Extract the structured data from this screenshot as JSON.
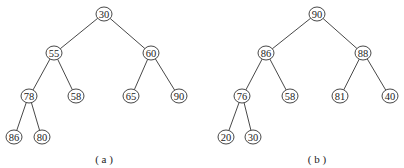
{
  "trees": [
    {
      "caption": "( a )",
      "caption_pos": [
        104,
        159
      ],
      "nodes": [
        {
          "id": "a0",
          "label": "30",
          "x": 104,
          "y": 14
        },
        {
          "id": "a1",
          "label": "55",
          "x": 54,
          "y": 53
        },
        {
          "id": "a2",
          "label": "60",
          "x": 151,
          "y": 53
        },
        {
          "id": "a3",
          "label": "78",
          "x": 29,
          "y": 96
        },
        {
          "id": "a4",
          "label": "58",
          "x": 76,
          "y": 96
        },
        {
          "id": "a5",
          "label": "65",
          "x": 131,
          "y": 96
        },
        {
          "id": "a6",
          "label": "90",
          "x": 179,
          "y": 96
        },
        {
          "id": "a7",
          "label": "86",
          "x": 14,
          "y": 137
        },
        {
          "id": "a8",
          "label": "80",
          "x": 42,
          "y": 137
        }
      ],
      "edges": [
        [
          "a0",
          "a1"
        ],
        [
          "a0",
          "a2"
        ],
        [
          "a1",
          "a3"
        ],
        [
          "a1",
          "a4"
        ],
        [
          "a2",
          "a5"
        ],
        [
          "a2",
          "a6"
        ],
        [
          "a3",
          "a7"
        ],
        [
          "a3",
          "a8"
        ]
      ]
    },
    {
      "caption": "( b )",
      "caption_pos": [
        317,
        159
      ],
      "nodes": [
        {
          "id": "b0",
          "label": "90",
          "x": 317,
          "y": 14
        },
        {
          "id": "b1",
          "label": "86",
          "x": 266,
          "y": 53
        },
        {
          "id": "b2",
          "label": "88",
          "x": 363,
          "y": 53
        },
        {
          "id": "b3",
          "label": "76",
          "x": 242,
          "y": 96
        },
        {
          "id": "b4",
          "label": "58",
          "x": 290,
          "y": 96
        },
        {
          "id": "b5",
          "label": "81",
          "x": 340,
          "y": 96
        },
        {
          "id": "b6",
          "label": "40",
          "x": 390,
          "y": 96
        },
        {
          "id": "b7",
          "label": "20",
          "x": 226,
          "y": 137
        },
        {
          "id": "b8",
          "label": "30",
          "x": 253,
          "y": 137
        }
      ],
      "edges": [
        [
          "b0",
          "b1"
        ],
        [
          "b0",
          "b2"
        ],
        [
          "b1",
          "b3"
        ],
        [
          "b1",
          "b4"
        ],
        [
          "b2",
          "b5"
        ],
        [
          "b2",
          "b6"
        ],
        [
          "b3",
          "b7"
        ],
        [
          "b3",
          "b8"
        ]
      ]
    }
  ],
  "node_radius": 8
}
